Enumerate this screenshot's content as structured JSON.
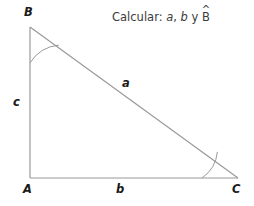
{
  "diagram": {
    "type": "right-triangle-geometry",
    "prompt": {
      "lead": "Calcular: ",
      "item_a": "a",
      "sep1": ", ",
      "item_b": "b",
      "conj": " y ",
      "item_angle": "B",
      "hat": "^"
    },
    "vertices": [
      {
        "name": "B",
        "label": "B",
        "x": 30,
        "y": 27
      },
      {
        "name": "A",
        "label": "A",
        "x": 30,
        "y": 178
      },
      {
        "name": "C",
        "label": "C",
        "x": 238,
        "y": 178
      }
    ],
    "sides": [
      {
        "name": "c",
        "label": "c",
        "from": "A",
        "to": "B"
      },
      {
        "name": "b",
        "label": "b",
        "from": "A",
        "to": "C"
      },
      {
        "name": "a",
        "label": "a",
        "from": "B",
        "to": "C"
      }
    ],
    "angle_arcs": [
      {
        "at": "B",
        "radius": 36
      },
      {
        "at": "C",
        "radius": 36
      }
    ],
    "colors": {
      "background": "#ffffff",
      "stroke": "#9a9a9a",
      "arc_stroke": "#9a9a9a",
      "label_text": "#1a1a1a",
      "prompt_text": "#3b3b3b"
    },
    "stroke_width": 1.2
  }
}
